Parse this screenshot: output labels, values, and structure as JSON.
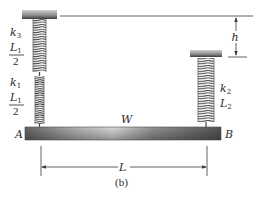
{
  "figure": {
    "caption": "(b)",
    "colors": {
      "line": "#3a3a3a",
      "beam_dark": "#5a5a5a",
      "beam_light": "#d8d8d8",
      "spring": "#4a4a4a",
      "support_dark": "#3c3c3c",
      "support_light": "#bdbdbd",
      "text": "#2a2a2a"
    }
  },
  "springs": {
    "k3": {
      "stiffness": "k",
      "stiffness_sub": "3",
      "length": "L",
      "length_sub": "1",
      "length_den": "2"
    },
    "k1": {
      "stiffness": "k",
      "stiffness_sub": "1",
      "length": "L",
      "length_sub": "1",
      "length_den": "2"
    },
    "k2": {
      "stiffness": "k",
      "stiffness_sub": "2",
      "length": "L",
      "length_sub": "2"
    }
  },
  "beam": {
    "weight_label": "W",
    "end_left": "A",
    "end_right": "B"
  },
  "dimensions": {
    "height_offset": "h",
    "span": "L"
  }
}
